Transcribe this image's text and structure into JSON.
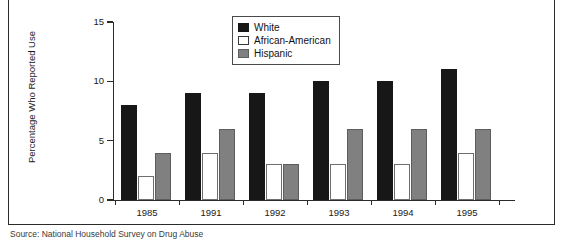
{
  "chart_data": {
    "type": "bar",
    "title": "",
    "xlabel": "",
    "ylabel": "Percentage Who Reported Use",
    "categories": [
      "1985",
      "1991",
      "1992",
      "1993",
      "1994",
      "1995"
    ],
    "series": [
      {
        "name": "White",
        "values": [
          8,
          9,
          9,
          10,
          10,
          11
        ]
      },
      {
        "name": "African-American",
        "values": [
          2,
          4,
          3,
          3,
          3,
          4
        ]
      },
      {
        "name": "Hispanic",
        "values": [
          4,
          6,
          3,
          6,
          6,
          6
        ]
      }
    ],
    "ylim": [
      0,
      15
    ],
    "yticks": [
      0,
      5,
      10,
      15
    ],
    "ytick_labels": [
      "0",
      "5",
      "10",
      "15"
    ],
    "grid": false,
    "legend_position": "top-center",
    "colors": {
      "White": "#171717",
      "African-American": "#ffffff",
      "Hispanic": "#808080"
    }
  },
  "legend": {
    "items": [
      {
        "label": "White",
        "swatch": "series-white"
      },
      {
        "label": "African-American",
        "swatch": "series-aa"
      },
      {
        "label": "Hispanic",
        "swatch": "series-hisp"
      }
    ]
  },
  "caption": {
    "text": "Source: National Household Survey on Drug Abuse"
  }
}
